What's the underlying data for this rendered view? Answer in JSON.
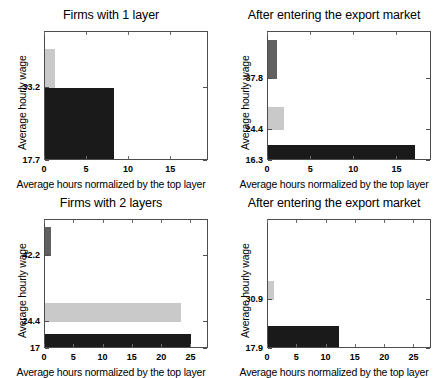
{
  "figure": {
    "width": 445,
    "height": 378,
    "background": "#ffffff",
    "colors": {
      "top_layer": "#606060",
      "middle_layer": "#c9c9c9",
      "bottom_layer": "#1a1a1a",
      "axis": "#4d4d4d",
      "text": "#000000"
    }
  },
  "chart_data": [
    {
      "id": "firms-1-layer",
      "type": "bar",
      "orientation": "horizontal-stacked-steps",
      "title": "Firms with 1 layer",
      "xlabel": "Average hours normalized by the top layer",
      "ylabel": "Average hourly wage",
      "xlim": [
        0,
        19.5
      ],
      "ylim": [
        17.7,
        45.0
      ],
      "xticks": [
        0,
        5,
        10,
        15
      ],
      "xticklabels": [
        "0",
        "5",
        "10",
        "15"
      ],
      "yticks": [
        33.2,
        17.7
      ],
      "yticklabels": [
        "33.2",
        "17.7"
      ],
      "grid": false,
      "layers": [
        {
          "name": "layer-1",
          "color": "#c9c9c9",
          "wage": 41.5,
          "base": 33.2,
          "hours": 1.2
        },
        {
          "name": "layer-0",
          "color": "#1a1a1a",
          "wage": 33.2,
          "base": 17.7,
          "hours": 8.2
        }
      ]
    },
    {
      "id": "firms-1-layer-export",
      "type": "bar",
      "orientation": "horizontal-stacked-steps",
      "title": "After entering the export market",
      "xlabel": "Average hours normalized by the top layer",
      "ylabel": "Average hourly wage",
      "xlim": [
        0,
        19.0
      ],
      "ylim": [
        16.3,
        50.0
      ],
      "xticks": [
        0,
        5,
        10,
        15
      ],
      "xticklabels": [
        "0",
        "5",
        "10",
        "15"
      ],
      "yticks": [
        37.8,
        24.4,
        16.3
      ],
      "yticklabels": [
        "37.8",
        "24.4",
        "16.3"
      ],
      "grid": false,
      "layers": [
        {
          "name": "layer-2",
          "color": "#606060",
          "wage": 48.0,
          "base": 37.8,
          "hours": 1.1
        },
        {
          "name": "layer-1",
          "color": "#c9c9c9",
          "wage": 30.5,
          "base": 24.4,
          "hours": 1.9
        },
        {
          "name": "layer-0",
          "color": "#1a1a1a",
          "wage": 20.5,
          "base": 16.3,
          "hours": 17.0
        }
      ]
    },
    {
      "id": "firms-2-layers",
      "type": "bar",
      "orientation": "horizontal-stacked-steps",
      "title": "Firms with 2 layers",
      "xlabel": "Average hours normalized by the top layer",
      "ylabel": "Average hourly wage",
      "xlim": [
        0,
        28.0
      ],
      "ylim": [
        17.0,
        52.0
      ],
      "xticks": [
        0,
        5,
        10,
        15,
        20,
        25
      ],
      "xticklabels": [
        "0",
        "5",
        "10",
        "15",
        "20",
        "25"
      ],
      "yticks": [
        42.2,
        24.4,
        17.0
      ],
      "yticklabels": [
        "42.2",
        "24.4",
        "17"
      ],
      "grid": false,
      "layers": [
        {
          "name": "layer-2",
          "color": "#606060",
          "wage": 50.0,
          "base": 42.2,
          "hours": 1.1
        },
        {
          "name": "layer-1",
          "color": "#c9c9c9",
          "wage": 29.5,
          "base": 24.4,
          "hours": 23.3
        },
        {
          "name": "layer-0",
          "color": "#1a1a1a",
          "wage": 21.0,
          "base": 17.0,
          "hours": 25.0
        }
      ]
    },
    {
      "id": "firms-2-layers-export",
      "type": "bar",
      "orientation": "horizontal-stacked-steps",
      "title": "After entering the export market",
      "xlabel": "Average hours normalized by the top layer",
      "ylabel": "Average hourly wage",
      "xlim": [
        0,
        28.0
      ],
      "ylim": [
        17.9,
        52.0
      ],
      "xticks": [
        0,
        5,
        10,
        15,
        20,
        25
      ],
      "xticklabels": [
        "0",
        "5",
        "10",
        "15",
        "20",
        "25"
      ],
      "yticks": [
        30.9,
        17.9
      ],
      "yticklabels": [
        "30.9",
        "17.9"
      ],
      "grid": false,
      "layers": [
        {
          "name": "layer-1",
          "color": "#c9c9c9",
          "wage": 36.0,
          "base": 30.9,
          "hours": 1.1
        },
        {
          "name": "layer-0",
          "color": "#1a1a1a",
          "wage": 24.0,
          "base": 17.9,
          "hours": 12.1
        }
      ]
    }
  ],
  "panels": {
    "p0": {
      "title": "Firms with 1 layer",
      "xaxis_title": "Average hours normalized by the top layer",
      "yaxis_title": "Average hourly wage",
      "ylabels": [
        "33.2",
        "17.7"
      ],
      "xlabels": [
        "0",
        "5",
        "10",
        "15"
      ]
    },
    "p1": {
      "title": "After entering the export market",
      "xaxis_title": "Average hours normalized by the top layer",
      "yaxis_title": "Average hourly wage",
      "ylabels": [
        "37.8",
        "24.4",
        "16.3"
      ],
      "xlabels": [
        "0",
        "5",
        "10",
        "15"
      ]
    },
    "p2": {
      "title": "Firms with 2 layers",
      "xaxis_title": "Average hours normalized by the top layer",
      "yaxis_title": "Average hourly wage",
      "ylabels": [
        "42.2",
        "24.4",
        "17"
      ],
      "xlabels": [
        "0",
        "5",
        "10",
        "15",
        "20",
        "25"
      ]
    },
    "p3": {
      "title": "After entering the export market",
      "xaxis_title": "Average hours normalized by the top layer",
      "yaxis_title": "Average hourly wage",
      "ylabels": [
        "30.9",
        "17.9"
      ],
      "xlabels": [
        "0",
        "5",
        "10",
        "15",
        "20",
        "25"
      ]
    }
  }
}
